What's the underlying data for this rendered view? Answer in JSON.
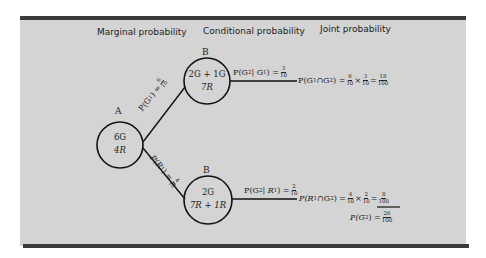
{
  "headers": {
    "marginal": "Marginal probability",
    "conditional": "Conditional probability",
    "joint": "Joint probability"
  },
  "nodes": {
    "a": {
      "label": "A",
      "line1": "6G",
      "line2": "4R"
    },
    "b_top": {
      "label": "B",
      "line1": "2G + 1G",
      "line2": "7R"
    },
    "b_bottom": {
      "label": "B",
      "line1": "2G",
      "line2": "7R + 1R"
    }
  },
  "branches": {
    "upper": {
      "prefix": "P(G",
      "sub": "1",
      "suffix": ") =",
      "num": "6",
      "den": "10"
    },
    "lower": {
      "prefix": "P(R",
      "sub": "1",
      "suffix": ") =",
      "num": "4",
      "den": "10"
    }
  },
  "conditional": {
    "top": {
      "text_a": "P(G",
      "sub_a": "2",
      "text_b": " | G",
      "sub_b": "1",
      "text_c": ") =",
      "num": "3",
      "den": "10"
    },
    "bottom": {
      "text_a": "P(G",
      "sub_a": "2",
      "text_b": " | R",
      "sub_b": "1",
      "text_c": ") =",
      "num": "2",
      "den": "10"
    }
  },
  "joint": {
    "top": {
      "text_a": "P(G",
      "sub_a": "1",
      "text_b": "∩G",
      "sub_b": "2",
      "text_c": ") =",
      "f1_num": "6",
      "f1_den": "10",
      "times": "×",
      "f2_num": "3",
      "f2_den": "10",
      "eq": "=",
      "res_num": "18",
      "res_den": "100"
    },
    "bottom": {
      "text_a": "P(R",
      "sub_a": "1",
      "text_b": "∩G",
      "sub_b": "2",
      "text_c": ") =",
      "f1_num": "4",
      "f1_den": "10",
      "times": "×",
      "f2_num": "2",
      "f2_den": "10",
      "eq": "=",
      "res_num": "8",
      "res_den": "100"
    },
    "total": {
      "text_a": "P(G",
      "sub_a": "2",
      "text_c": ") =",
      "num": "26",
      "den": "100"
    }
  },
  "colors": {
    "panel": "#d4d4d4",
    "border": "#3a3a3a",
    "ink": "#222222"
  }
}
